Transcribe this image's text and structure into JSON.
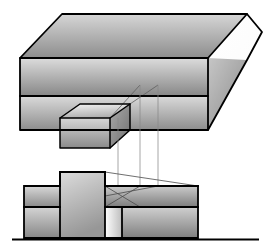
{
  "figure": {
    "kind": "engineering-drawing",
    "title": "",
    "background_color": "#ffffff",
    "width": 271,
    "height": 249,
    "line_color": "#000000",
    "thin_line_color": "#7a7a7a",
    "stroke_heavy": 1.8,
    "stroke_thin": 0.7
  },
  "palette": {
    "gray_light": "#e8e8e8",
    "gray_mid": "#b4b4b4",
    "gray_dark": "#8c8c8c",
    "gray_darker": "#6e6e6e",
    "gray_deep": "#5a5a5a",
    "white": "#ffffff",
    "black": "#000000"
  },
  "isometric_view": {
    "name": "pictorial-block",
    "top_face": {
      "label": "top-face",
      "points": "20,58 62,14 247,14 208,58",
      "fill_from": "#cfcfcf",
      "fill_to": "#8f8f8f"
    },
    "right_tip_face": {
      "label": "right-tip-face",
      "points": "247,14 262,32 247,60 208,96 208,58",
      "fill_from": "#ffffff",
      "fill_to": "#f2f2f2"
    },
    "front_upper_band": {
      "label": "front-upper-band",
      "points": "20,58 208,58 208,96 20,96",
      "fill_from": "#d8d8d8",
      "fill_to": "#8a8a8a"
    },
    "front_lower_band": {
      "label": "front-lower-band",
      "points": "20,96 208,96 208,130 20,130",
      "fill_from": "#d6d6d6",
      "fill_to": "#909090"
    },
    "right_lower_wedge": {
      "label": "right-lower-wedge",
      "points": "208,58 247,60 208,130",
      "fill_from": "#c8c8c8",
      "fill_to": "#8a8a8a"
    },
    "tab_top_face": {
      "label": "tab-top-face",
      "points": "60,118 80,104 130,104 110,118",
      "fill_from": "#efefef",
      "fill_to": "#b5b5b5"
    },
    "tab_front_face": {
      "label": "tab-front-face",
      "points": "60,118 110,118 110,148 60,148",
      "fill_from": "#d2d2d2",
      "fill_to": "#8e8e8e"
    },
    "tab_right_face": {
      "label": "tab-right-face",
      "points": "110,118 130,104 130,130 110,148",
      "fill_from": "#a8a8a8",
      "fill_to": "#777777"
    },
    "edge_paths": [
      "M20,58 L62,14 L247,14 L262,32 L247,60 L208,130 L20,130 Z",
      "M20,58 L208,58 L247,14",
      "M20,96 L208,96",
      "M208,58 L208,130",
      "M208,58 L247,60",
      "M60,118 L80,104 L130,104 L130,130",
      "M60,118 L110,118 L130,104",
      "M60,118 L60,148 L110,148 L110,118",
      "M110,148 L130,130",
      "M130,104 L158,85",
      "M110,118 L140,85"
    ]
  },
  "projection_lines": {
    "name": "vertical-projection-lines",
    "lines": [
      {
        "label": "projector-left",
        "x": 118,
        "y1": 118,
        "y2": 214
      },
      {
        "label": "projector-middle",
        "x": 140,
        "y1": 85,
        "y2": 205
      },
      {
        "label": "projector-right",
        "x": 158,
        "y1": 85,
        "y2": 205
      }
    ]
  },
  "elevation_view": {
    "name": "front-elevation",
    "left_block_upper": {
      "label": "left-block-upper",
      "points": "24,186 60,186 60,207 24,207",
      "fill_from": "#d4d4d4",
      "fill_to": "#8e8e8e"
    },
    "left_block_lower": {
      "label": "left-block-lower",
      "points": "24,207 60,207 60,238 24,238",
      "fill_from": "#d0d0d0",
      "fill_to": "#8a8a8a"
    },
    "center_tall_block": {
      "label": "center-tall-block",
      "points": "60,172 105,172 105,238 60,238",
      "fill_from": "#d8d8d8",
      "fill_to": "#9a9a9a"
    },
    "notch_strip": {
      "label": "notch-light-strip",
      "points": "105,207 122,207 122,238 105,238",
      "fill_from": "#ffffff",
      "fill_to": "#c0c0c0"
    },
    "right_block_upper": {
      "label": "right-block-upper",
      "points": "105,186 198,186 198,207 105,207",
      "fill_from": "#c8c8c8",
      "fill_to": "#808080"
    },
    "right_block_lower": {
      "label": "right-block-lower",
      "points": "122,207 198,207 198,238 122,238",
      "fill_from": "#cccccc",
      "fill_to": "#828282"
    },
    "hidden_detail_paths": [
      "M105,186 L198,186",
      "M105,207 L198,207",
      "M105,186 L105,238",
      "M122,207 L122,238",
      "M105,172 L198,186",
      "M105,186 L140,205",
      "M105,196 L158,186",
      "M118,186 L118,214",
      "M105,207 L140,186"
    ],
    "outline_paths": [
      "M24,186 L60,186 L60,172 L105,172 L105,186 L198,186 L198,238 L24,238 Z",
      "M24,207 L60,207",
      "M60,172 L60,238",
      "M105,172 L105,238"
    ],
    "ground_line": {
      "label": "ground-line",
      "x1": 12,
      "y1": 239.5,
      "x2": 259,
      "y2": 239.5
    }
  }
}
